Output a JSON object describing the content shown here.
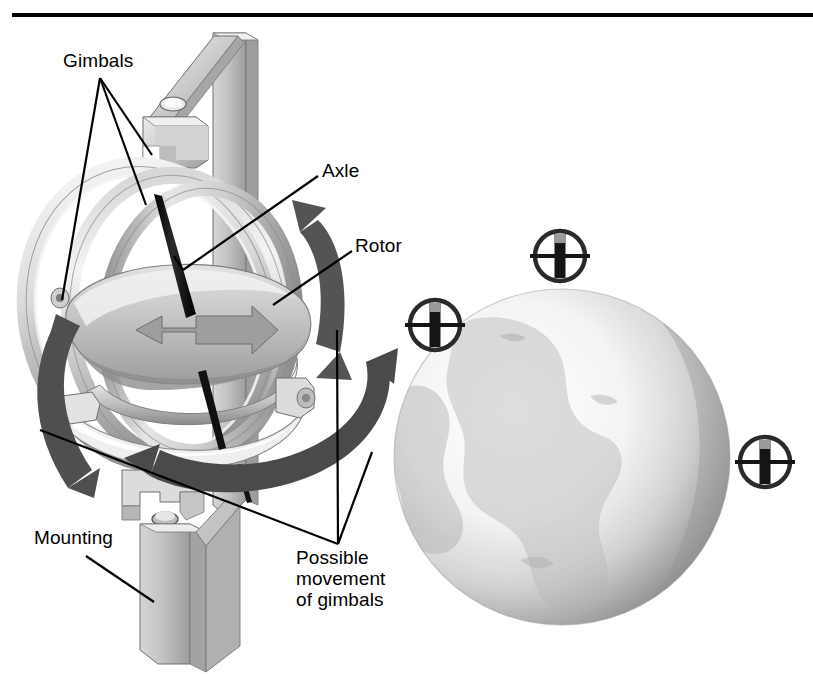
{
  "figure": {
    "kind": "technical-illustration",
    "rule": {
      "name": "top-rule",
      "y": 15,
      "x1": 12,
      "x2": 813,
      "color": "#000000"
    },
    "background": "#ffffff"
  },
  "labels": [
    {
      "id": "gimbals",
      "text": "Gimbals",
      "x": 63,
      "y": 52,
      "lines": [
        "Gimbals"
      ]
    },
    {
      "id": "axle",
      "text": "Axle",
      "x": 322,
      "y": 162,
      "lines": [
        "Axle"
      ]
    },
    {
      "id": "rotor",
      "text": "Rotor",
      "x": 355,
      "y": 237,
      "lines": [
        "Rotor"
      ]
    },
    {
      "id": "mounting",
      "text": "Mounting",
      "x": 34,
      "y": 529,
      "lines": [
        "Mounting"
      ]
    },
    {
      "id": "possible-movement",
      "text": "Possible movement of gimbals",
      "x": 296,
      "y": 549,
      "lines": [
        "Possible",
        "movement",
        "of gimbals"
      ]
    }
  ],
  "label_text": {
    "gimbals": "Gimbals",
    "axle": "Axle",
    "rotor": "Rotor",
    "mounting": "Mounting",
    "possible_1": "Possible",
    "possible_2": "movement",
    "possible_3": "of gimbals"
  },
  "gyro_symbols": [
    {
      "id": "gyro-symbol-left",
      "cx": 435,
      "cy": 325,
      "r": 26
    },
    {
      "id": "gyro-symbol-top",
      "cx": 560,
      "cy": 256,
      "r": 26
    },
    {
      "id": "gyro-symbol-right",
      "cx": 765,
      "cy": 462,
      "r": 26
    }
  ],
  "globe": {
    "cx": 562,
    "cy": 457,
    "r": 168,
    "name": "earth-globe"
  },
  "colors": {
    "ink": "#000000",
    "metal_light": "#e9e9e9",
    "metal_mid": "#c9c9c9",
    "metal_dark": "#9a9a9a",
    "metal_shadow": "#777777",
    "arrow_dark": "#4a4a4a",
    "arrow_mid": "#7d7d7d",
    "globe_light": "#f3f3f3",
    "globe_mid": "#c6c6c6",
    "globe_dark": "#8e8e8e"
  },
  "parts": [
    {
      "name": "outer-gimbal-ring"
    },
    {
      "name": "middle-gimbal-ring"
    },
    {
      "name": "inner-gimbal-ring"
    },
    {
      "name": "rotor-disc"
    },
    {
      "name": "spin-axle"
    },
    {
      "name": "support-bracket"
    },
    {
      "name": "mounting-post"
    },
    {
      "name": "pivot-screw"
    },
    {
      "name": "movement-arrow-left"
    },
    {
      "name": "movement-arrow-right"
    },
    {
      "name": "movement-arrow-bottom"
    },
    {
      "name": "rotor-spin-arrow"
    }
  ]
}
